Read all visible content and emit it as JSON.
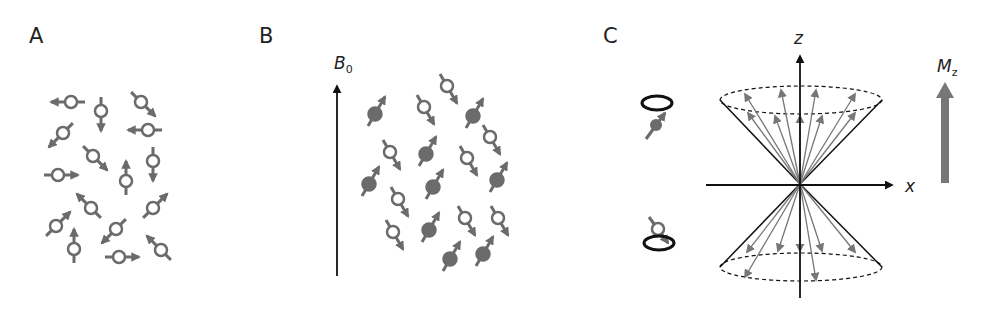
{
  "figure": {
    "panels": [
      {
        "id": "A",
        "label": "A",
        "description": "Randomly oriented nuclear spins without external field"
      },
      {
        "id": "B",
        "label": "B",
        "field_label": "B",
        "field_subscript": "0",
        "description": "Spins aligned parallel / antiparallel to B0"
      },
      {
        "id": "C",
        "label": "C",
        "z_axis_label": "z",
        "x_axis_label": "x",
        "magnetization_label": "M",
        "magnetization_subscript": "z",
        "description": "Precession cones of spin-up and spin-down populations with net magnetization Mz"
      }
    ]
  },
  "colors": {
    "spin": "#6b6b6b",
    "spin_filled": "#6b6b6b",
    "axis": "#111111",
    "mz_arrow": "#777777"
  },
  "panelA": {
    "spins": [
      {
        "x": 71,
        "y": 102,
        "angle": 180
      },
      {
        "x": 101,
        "y": 111,
        "angle": 90
      },
      {
        "x": 141,
        "y": 102,
        "angle": 45
      },
      {
        "x": 148,
        "y": 130,
        "angle": 180
      },
      {
        "x": 63,
        "y": 133,
        "angle": 135
      },
      {
        "x": 93,
        "y": 156,
        "angle": 45
      },
      {
        "x": 126,
        "y": 181,
        "angle": -90
      },
      {
        "x": 153,
        "y": 161,
        "angle": 90
      },
      {
        "x": 58,
        "y": 175,
        "angle": 0
      },
      {
        "x": 91,
        "y": 208,
        "angle": -135
      },
      {
        "x": 153,
        "y": 208,
        "angle": -45
      },
      {
        "x": 56,
        "y": 226,
        "angle": -45
      },
      {
        "x": 74,
        "y": 249,
        "angle": -90
      },
      {
        "x": 116,
        "y": 229,
        "angle": 135
      },
      {
        "x": 119,
        "y": 257,
        "angle": 0
      },
      {
        "x": 161,
        "y": 250,
        "angle": -135
      }
    ]
  },
  "panelB": {
    "spins": [
      {
        "x": 375,
        "y": 114,
        "filled": true
      },
      {
        "x": 447,
        "y": 86,
        "filled": false
      },
      {
        "x": 424,
        "y": 107,
        "filled": false
      },
      {
        "x": 473,
        "y": 116,
        "filled": true
      },
      {
        "x": 490,
        "y": 137,
        "filled": false
      },
      {
        "x": 390,
        "y": 152,
        "filled": false
      },
      {
        "x": 426,
        "y": 154,
        "filled": true
      },
      {
        "x": 467,
        "y": 158,
        "filled": false
      },
      {
        "x": 497,
        "y": 180,
        "filled": true
      },
      {
        "x": 369,
        "y": 184,
        "filled": true
      },
      {
        "x": 398,
        "y": 199,
        "filled": false
      },
      {
        "x": 433,
        "y": 187,
        "filled": true
      },
      {
        "x": 465,
        "y": 218,
        "filled": false
      },
      {
        "x": 498,
        "y": 218,
        "filled": false
      },
      {
        "x": 393,
        "y": 232,
        "filled": false
      },
      {
        "x": 429,
        "y": 230,
        "filled": true
      },
      {
        "x": 450,
        "y": 259,
        "filled": true
      },
      {
        "x": 483,
        "y": 254,
        "filled": true
      }
    ]
  }
}
